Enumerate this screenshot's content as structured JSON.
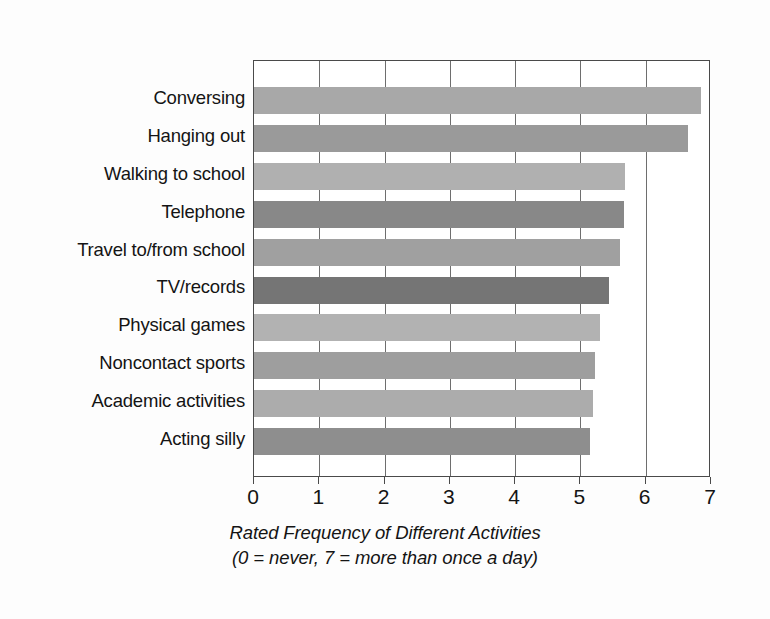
{
  "chart_data": {
    "type": "bar",
    "orientation": "horizontal",
    "title": "",
    "xlabel": "Rated Frequency of Different Activities",
    "xlabel_note": "(0 = never,  7 = more than once a day)",
    "ylabel": "",
    "xlim": [
      0,
      7
    ],
    "xticks": [
      0,
      1,
      2,
      3,
      4,
      5,
      6,
      7
    ],
    "xtick_labels": [
      "0",
      "1",
      "2",
      "3",
      "4",
      "5",
      "6",
      "7"
    ],
    "grid": true,
    "legend": "none",
    "categories": [
      "Conversing",
      "Hanging out",
      "Walking to school",
      "Telephone",
      "Travel to/from school",
      "TV/records",
      "Physical games",
      "Noncontact sports",
      "Academic activities",
      "Acting silly"
    ],
    "values": [
      6.85,
      6.65,
      5.68,
      5.66,
      5.6,
      5.43,
      5.3,
      5.22,
      5.2,
      5.15
    ],
    "bar_colors": [
      "#a8a8a8",
      "#9a9a9a",
      "#b0b0b0",
      "#888888",
      "#a0a0a0",
      "#757575",
      "#b2b2b2",
      "#9e9e9e",
      "#acacac",
      "#8e8e8e"
    ]
  },
  "caption": {
    "line1": "Rated Frequency of Different Activities",
    "line2": "(0 = never,  7 = more than once a day)"
  },
  "colors": {
    "frame": "#4a4a4a",
    "gridline": "#6e6e6e",
    "background": "#fdfdfd",
    "plot_background": "#ffffff",
    "text": "#141414"
  }
}
